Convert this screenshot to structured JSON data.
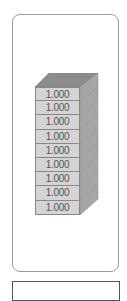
{
  "block_stack": {
    "count": 9,
    "blocks": [
      "1.000",
      "1.000",
      "1.000",
      "1.000",
      "1.000",
      "1.000",
      "1.000",
      "1.000",
      "1.000"
    ]
  },
  "colors": {
    "front": "#d4d4d4",
    "top": "#8c8c8c",
    "side": "#a6a6a6",
    "border": "#888888"
  }
}
